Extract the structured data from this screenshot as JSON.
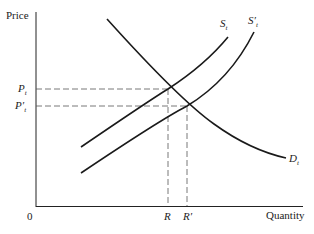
{
  "axes": {
    "y_label": "Price",
    "x_label": "Quantity",
    "origin_label": "0"
  },
  "curves": {
    "supply": {
      "label": "S",
      "subscript": "t"
    },
    "supply_shifted": {
      "label": "S′",
      "subscript": "t"
    },
    "demand": {
      "label": "D",
      "subscript": "t"
    }
  },
  "price_levels": [
    {
      "label": "P",
      "subscript": "t"
    },
    {
      "label": "P′",
      "subscript": "t"
    }
  ],
  "quantity_levels": [
    {
      "label": "R"
    },
    {
      "label": "R′"
    }
  ],
  "colors": {
    "line": "#1a1a1a",
    "dash": "#555555"
  }
}
